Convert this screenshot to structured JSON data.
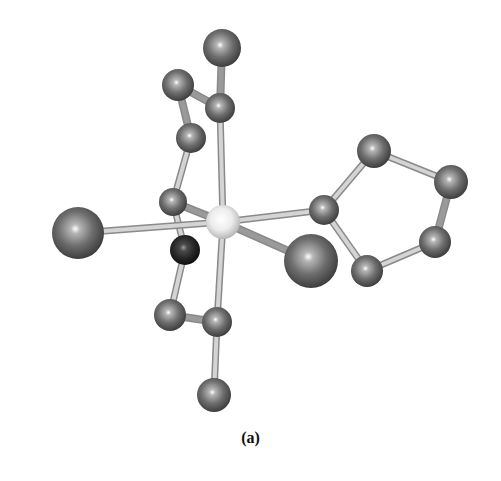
{
  "figure": {
    "caption": "(a)",
    "type": "ball-and-stick molecular structure",
    "colors": {
      "background": "#ffffff",
      "atom_gray": "#6e6e6e",
      "atom_dark": "#262626",
      "atom_center": "#e8e8e8",
      "bond": "#d4d4d4",
      "bond_edge": "#8a8a8a",
      "bond_heavy": "#9a9a9a"
    },
    "atoms": [
      {
        "id": "top",
        "x": 222,
        "y": 48,
        "r": 19,
        "kind": "gray"
      },
      {
        "id": "upper-left",
        "x": 178,
        "y": 85,
        "r": 16,
        "kind": "gray"
      },
      {
        "id": "upper-center",
        "x": 220,
        "y": 108,
        "r": 15,
        "kind": "gray"
      },
      {
        "id": "upper-mid-left",
        "x": 191,
        "y": 138,
        "r": 15,
        "kind": "gray"
      },
      {
        "id": "mid-left",
        "x": 173,
        "y": 202,
        "r": 14,
        "kind": "gray"
      },
      {
        "id": "dark",
        "x": 185,
        "y": 250,
        "r": 15,
        "kind": "dark"
      },
      {
        "id": "far-left-big",
        "x": 78,
        "y": 233,
        "r": 26,
        "kind": "gray"
      },
      {
        "id": "right-big",
        "x": 311,
        "y": 261,
        "r": 27,
        "kind": "gray"
      },
      {
        "id": "ring-attach",
        "x": 324,
        "y": 210,
        "r": 15,
        "kind": "gray"
      },
      {
        "id": "ring-top",
        "x": 374,
        "y": 151,
        "r": 17,
        "kind": "gray"
      },
      {
        "id": "ring-right-top",
        "x": 451,
        "y": 182,
        "r": 17,
        "kind": "gray"
      },
      {
        "id": "ring-right-bot",
        "x": 435,
        "y": 242,
        "r": 16,
        "kind": "gray"
      },
      {
        "id": "ring-bot-left",
        "x": 367,
        "y": 271,
        "r": 16,
        "kind": "gray"
      },
      {
        "id": "lower-left",
        "x": 170,
        "y": 315,
        "r": 16,
        "kind": "gray"
      },
      {
        "id": "lower-center",
        "x": 217,
        "y": 322,
        "r": 15,
        "kind": "gray"
      },
      {
        "id": "bottom",
        "x": 214,
        "y": 395,
        "r": 17,
        "kind": "gray"
      },
      {
        "id": "center",
        "x": 223,
        "y": 222,
        "r": 17,
        "kind": "center"
      }
    ],
    "bonds": [
      {
        "a": "top",
        "b": "upper-center",
        "style": "heavy"
      },
      {
        "a": "upper-left",
        "b": "upper-center",
        "style": "heavy"
      },
      {
        "a": "upper-left",
        "b": "upper-mid-left",
        "style": "heavy"
      },
      {
        "a": "upper-mid-left",
        "b": "mid-left",
        "style": "normal"
      },
      {
        "a": "upper-center",
        "b": "center",
        "style": "normal"
      },
      {
        "a": "mid-left",
        "b": "center",
        "style": "heavy"
      },
      {
        "a": "mid-left",
        "b": "dark",
        "style": "normal"
      },
      {
        "a": "far-left-big",
        "b": "center",
        "style": "normal"
      },
      {
        "a": "center",
        "b": "ring-attach",
        "style": "normal"
      },
      {
        "a": "center",
        "b": "right-big",
        "style": "heavy"
      },
      {
        "a": "center",
        "b": "lower-center",
        "style": "normal"
      },
      {
        "a": "ring-attach",
        "b": "ring-top",
        "style": "normal"
      },
      {
        "a": "ring-top",
        "b": "ring-right-top",
        "style": "normal"
      },
      {
        "a": "ring-right-top",
        "b": "ring-right-bot",
        "style": "heavy"
      },
      {
        "a": "ring-right-bot",
        "b": "ring-bot-left",
        "style": "normal"
      },
      {
        "a": "ring-bot-left",
        "b": "ring-attach",
        "style": "normal"
      },
      {
        "a": "dark",
        "b": "lower-left",
        "style": "normal"
      },
      {
        "a": "lower-left",
        "b": "lower-center",
        "style": "heavy"
      },
      {
        "a": "lower-center",
        "b": "bottom",
        "style": "normal"
      }
    ]
  }
}
